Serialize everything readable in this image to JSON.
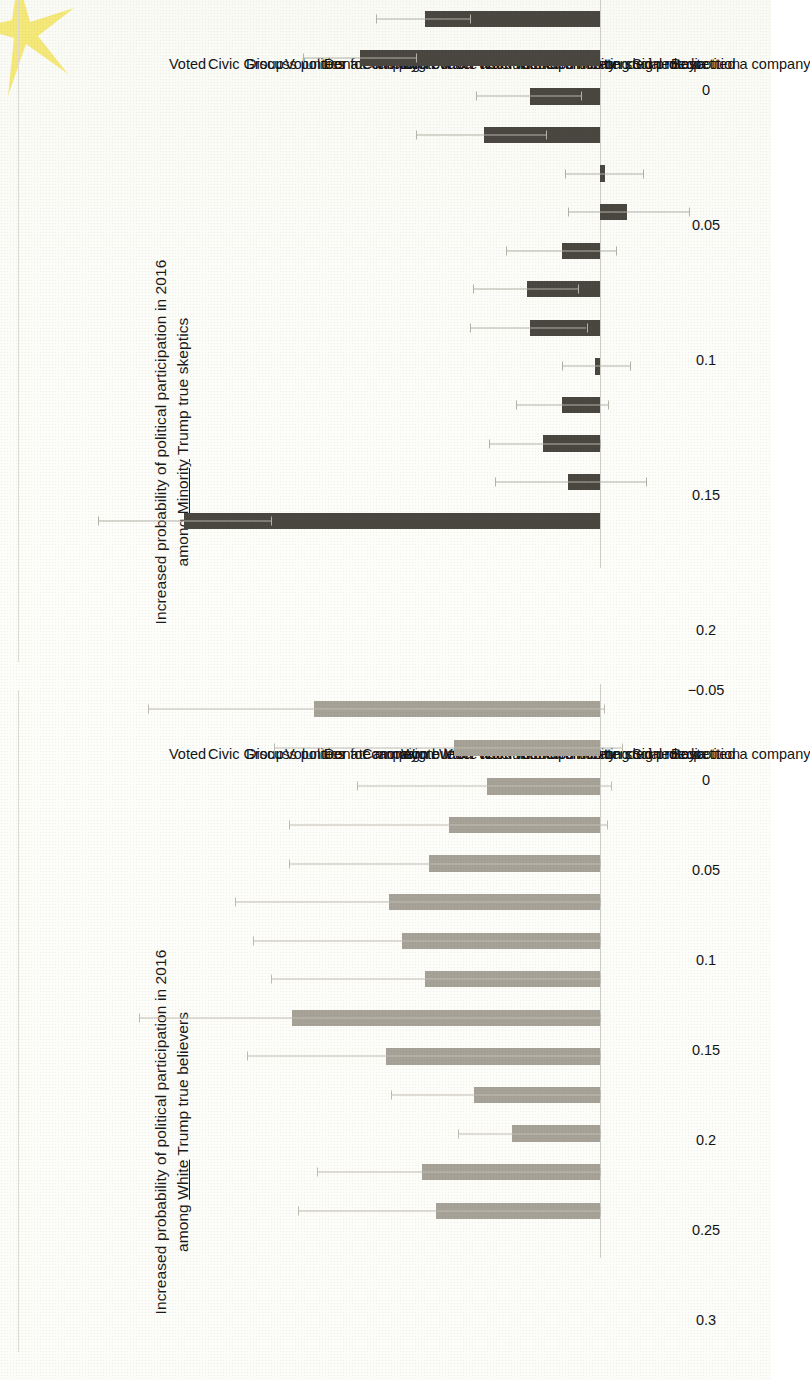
{
  "figure": {
    "kind": "two-panel-horizontal-bar-figure",
    "orientation": "page rotated 90 degrees (charts read sideways)",
    "page_background": "#fdfdfb",
    "highlight_mark_color": "#f3e770"
  },
  "panels": [
    {
      "id": "minority-skeptics",
      "position": "top-half-of-page",
      "axis_title_line1": "Increased probability of political participation in 2016",
      "axis_title_line2_pre": "among ",
      "axis_title_line2_underlined": "Minority",
      "axis_title_line2_post": " Trump true skeptics",
      "bar_color": "#4a4740",
      "error_color": "#b4b1a6"
    },
    {
      "id": "white-believers",
      "position": "bottom-half-of-page",
      "axis_title_line1": "Increased probability of political participation in 2016",
      "axis_title_line2_pre": "among ",
      "axis_title_line2_underlined": "White",
      "axis_title_line2_post": " Trump true believers",
      "bar_color": "#a6a297",
      "error_color": "#bfbcb2"
    }
  ],
  "chart_data": [
    {
      "type": "bar",
      "id": "minority-skeptics",
      "title": "Increased probability of political participation in 2016 among Minority Trump true skeptics",
      "xlabel": "",
      "ylabel": "Increased probability of political participation in 2016",
      "orientation": "vertical bars drawn on a sideways-rotated page",
      "grid": false,
      "legend": "none",
      "ylim": [
        -0.05,
        0.2
      ],
      "yticks": [
        -0.05,
        0,
        0.05,
        0.1,
        0.15,
        0.2
      ],
      "ytick_labels": [
        "−0.05",
        "0",
        "0.05",
        "0.1",
        "0.15",
        "0.2"
      ],
      "categories": [
        "Voted",
        "Civic Group",
        "Discuss politics",
        "Volunteer for campaign",
        "Donate money",
        "Campaign button",
        "Wrote letter about issue",
        "Wrote letter for help",
        "Work with community",
        "Attended meeting",
        "Politics on social media",
        "Attended protest",
        "Signed a petition",
        "Boycotted a company"
      ],
      "values": [
        0.154,
        0.012,
        0.021,
        0.014,
        0.002,
        0.026,
        0.027,
        0.014,
        -0.01,
        -0.002,
        0.043,
        0.026,
        0.089,
        0.065
      ],
      "error_low": [
        0.122,
        -0.017,
        0.0,
        -0.003,
        -0.011,
        0.005,
        0.008,
        -0.006,
        -0.033,
        -0.016,
        0.02,
        0.007,
        0.068,
        0.048
      ],
      "error_high": [
        0.186,
        0.039,
        0.041,
        0.031,
        0.014,
        0.048,
        0.047,
        0.035,
        0.012,
        0.013,
        0.068,
        0.046,
        0.11,
        0.083
      ]
    },
    {
      "type": "bar",
      "id": "white-believers",
      "title": "Increased probability of political participation in 2016 among White Trump true believers",
      "xlabel": "",
      "ylabel": "Increased probability of political participation in 2016",
      "orientation": "vertical bars drawn on a sideways-rotated page",
      "grid": false,
      "legend": "none",
      "ylim": [
        -0.05,
        0.3
      ],
      "yticks": [
        -0.05,
        0,
        0.05,
        0.1,
        0.15,
        0.2,
        0.25,
        0.3
      ],
      "ytick_labels": [
        "−0.05",
        "0",
        "0.05",
        "0.1",
        "0.15",
        "0.2",
        "0.25",
        "0.3"
      ],
      "categories": [
        "Voted",
        "Civic Group",
        "Discuss politics",
        "Volunteer for campaign",
        "Donate money",
        "Campaign button",
        "Wrote letter about issue",
        "Wrote letter for help",
        "Work with community",
        "Attended meeting",
        "Politics on social media",
        "Attended protest",
        "Signed a petition",
        "Boycotted a company"
      ],
      "values": [
        0.091,
        0.099,
        0.049,
        0.07,
        0.119,
        0.171,
        0.097,
        0.11,
        0.117,
        0.095,
        0.084,
        0.063,
        0.081,
        0.159
      ],
      "error_low": [
        0.0,
        0.0,
        0.0,
        0.0,
        0.0,
        0.0,
        0.0,
        0.0,
        0.0,
        0.0,
        -0.004,
        -0.006,
        -0.012,
        -0.002
      ],
      "error_high": [
        0.168,
        0.157,
        0.079,
        0.116,
        0.196,
        0.256,
        0.183,
        0.193,
        0.203,
        0.173,
        0.173,
        0.135,
        0.181,
        0.251
      ]
    }
  ]
}
